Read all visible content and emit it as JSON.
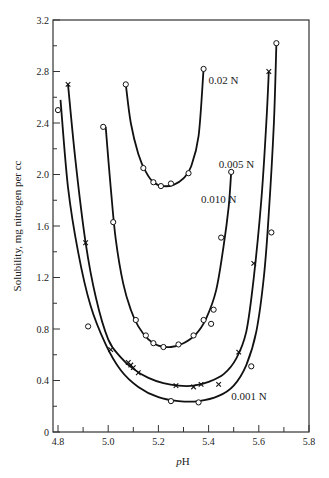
{
  "chart_data": {
    "type": "scatter",
    "title": "",
    "xlabel": "pH",
    "ylabel": "Solubility, mg nitrogen per cc",
    "xlim": [
      4.8,
      5.8
    ],
    "ylim": [
      0,
      3.2
    ],
    "xticks": [
      4.8,
      5.0,
      5.2,
      5.4,
      5.6,
      5.8
    ],
    "xtick_labels": [
      "4.8",
      "5.0",
      "5.2",
      "5.4",
      "5.6",
      "5.8"
    ],
    "xminor": [
      4.9,
      5.1,
      5.3,
      5.5,
      5.7
    ],
    "yticks": [
      0,
      0.4,
      0.8,
      1.2,
      1.6,
      2.0,
      2.4,
      2.8,
      3.2
    ],
    "ytick_labels": [
      "0",
      "0.4",
      "0.8",
      "1.2",
      "1.6",
      "2.0",
      "2.4",
      "2.8",
      "3.2"
    ],
    "yminor": [
      0.2,
      0.6,
      1.0,
      1.4,
      1.8,
      2.2,
      2.6,
      3.0
    ],
    "grid": false,
    "legend": "inline curve labels",
    "series": [
      {
        "name": "0.02 N",
        "marker": "o",
        "label_pos": [
          5.4,
          2.7
        ],
        "points": [
          [
            5.07,
            2.7
          ],
          [
            5.14,
            2.05
          ],
          [
            5.18,
            1.94
          ],
          [
            5.21,
            1.91
          ],
          [
            5.25,
            1.93
          ],
          [
            5.32,
            2.01
          ],
          [
            5.38,
            2.82
          ]
        ],
        "curve": [
          [
            5.07,
            2.7
          ],
          [
            5.09,
            2.4
          ],
          [
            5.12,
            2.16
          ],
          [
            5.15,
            2.02
          ],
          [
            5.18,
            1.94
          ],
          [
            5.22,
            1.91
          ],
          [
            5.26,
            1.92
          ],
          [
            5.3,
            1.97
          ],
          [
            5.33,
            2.06
          ],
          [
            5.36,
            2.3
          ],
          [
            5.38,
            2.82
          ]
        ]
      },
      {
        "name": "0.010 N",
        "marker": "o",
        "label_pos": [
          5.37,
          1.78
        ],
        "points": [
          [
            4.98,
            2.37
          ],
          [
            5.02,
            1.63
          ],
          [
            5.11,
            0.87
          ],
          [
            5.15,
            0.75
          ],
          [
            5.18,
            0.69
          ],
          [
            5.22,
            0.66
          ],
          [
            5.28,
            0.68
          ],
          [
            5.34,
            0.75
          ],
          [
            5.38,
            0.87
          ],
          [
            5.41,
            0.84
          ],
          [
            5.42,
            0.95
          ],
          [
            5.45,
            1.51
          ],
          [
            5.49,
            2.02
          ]
        ],
        "curve": [
          [
            4.99,
            2.37
          ],
          [
            5.01,
            1.9
          ],
          [
            5.03,
            1.5
          ],
          [
            5.06,
            1.15
          ],
          [
            5.09,
            0.95
          ],
          [
            5.12,
            0.82
          ],
          [
            5.16,
            0.72
          ],
          [
            5.2,
            0.67
          ],
          [
            5.25,
            0.66
          ],
          [
            5.3,
            0.69
          ],
          [
            5.35,
            0.76
          ],
          [
            5.39,
            0.88
          ],
          [
            5.43,
            1.1
          ],
          [
            5.46,
            1.45
          ],
          [
            5.48,
            1.75
          ],
          [
            5.49,
            2.02
          ]
        ]
      },
      {
        "name": "0.005 N",
        "marker": "x",
        "label_pos": [
          5.44,
          2.05
        ],
        "points": [
          [
            4.84,
            2.7
          ],
          [
            4.91,
            1.47
          ],
          [
            5.01,
            0.64
          ],
          [
            5.08,
            0.54
          ],
          [
            5.09,
            0.52
          ],
          [
            5.1,
            0.5
          ],
          [
            5.12,
            0.46
          ],
          [
            5.27,
            0.36
          ],
          [
            5.34,
            0.35
          ],
          [
            5.37,
            0.37
          ],
          [
            5.44,
            0.37
          ],
          [
            5.52,
            0.62
          ],
          [
            5.58,
            1.31
          ],
          [
            5.64,
            2.8
          ]
        ],
        "curve": [
          [
            4.84,
            2.7
          ],
          [
            4.87,
            2.1
          ],
          [
            4.91,
            1.47
          ],
          [
            4.95,
            1.05
          ],
          [
            5.0,
            0.72
          ],
          [
            5.05,
            0.58
          ],
          [
            5.1,
            0.49
          ],
          [
            5.16,
            0.42
          ],
          [
            5.22,
            0.38
          ],
          [
            5.28,
            0.36
          ],
          [
            5.34,
            0.36
          ],
          [
            5.4,
            0.39
          ],
          [
            5.46,
            0.45
          ],
          [
            5.51,
            0.57
          ],
          [
            5.55,
            0.78
          ],
          [
            5.58,
            1.2
          ],
          [
            5.61,
            1.8
          ],
          [
            5.63,
            2.4
          ],
          [
            5.64,
            2.8
          ]
        ]
      },
      {
        "name": "0.001 N",
        "marker": "o",
        "label_pos": [
          5.49,
          0.25
        ],
        "points": [
          [
            4.8,
            2.5
          ],
          [
            4.92,
            0.82
          ],
          [
            5.25,
            0.24
          ],
          [
            5.36,
            0.23
          ],
          [
            5.57,
            0.51
          ],
          [
            5.65,
            1.55
          ],
          [
            5.67,
            3.02
          ]
        ],
        "curve": [
          [
            4.81,
            2.58
          ],
          [
            4.84,
            1.9
          ],
          [
            4.88,
            1.4
          ],
          [
            4.93,
            0.98
          ],
          [
            4.99,
            0.68
          ],
          [
            5.05,
            0.48
          ],
          [
            5.12,
            0.35
          ],
          [
            5.2,
            0.27
          ],
          [
            5.28,
            0.24
          ],
          [
            5.36,
            0.24
          ],
          [
            5.44,
            0.28
          ],
          [
            5.5,
            0.36
          ],
          [
            5.55,
            0.52
          ],
          [
            5.59,
            0.78
          ],
          [
            5.62,
            1.2
          ],
          [
            5.64,
            1.7
          ],
          [
            5.66,
            2.4
          ],
          [
            5.67,
            3.02
          ]
        ]
      }
    ]
  }
}
